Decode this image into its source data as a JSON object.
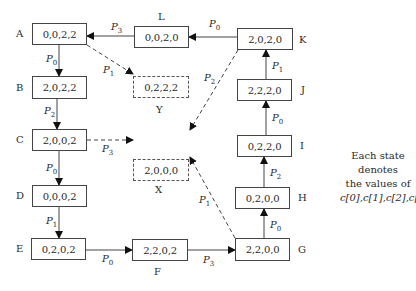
{
  "diagram": {
    "type": "state-transition",
    "states": [
      {
        "id": "A",
        "label": "A",
        "value": "0,0,2,2",
        "style": "solid"
      },
      {
        "id": "B",
        "label": "B",
        "value": "2,0,2,2",
        "style": "solid"
      },
      {
        "id": "C",
        "label": "C",
        "value": "2,0,0,2",
        "style": "solid"
      },
      {
        "id": "D",
        "label": "D",
        "value": "0,0,0,2",
        "style": "solid"
      },
      {
        "id": "E",
        "label": "E",
        "value": "0,2,0,2",
        "style": "solid"
      },
      {
        "id": "F",
        "label": "F",
        "value": "2,2,0,2",
        "style": "solid"
      },
      {
        "id": "G",
        "label": "G",
        "value": "2,2,0,0",
        "style": "solid"
      },
      {
        "id": "H",
        "label": "H",
        "value": "0,2,0,0",
        "style": "solid"
      },
      {
        "id": "I",
        "label": "I",
        "value": "0,2,2,0",
        "style": "solid"
      },
      {
        "id": "J",
        "label": "J",
        "value": "2,2,2,0",
        "style": "solid"
      },
      {
        "id": "K",
        "label": "K",
        "value": "2,0,2,0",
        "style": "solid"
      },
      {
        "id": "L",
        "label": "L",
        "value": "0,0,2,0",
        "style": "solid"
      },
      {
        "id": "Y",
        "label": "Y",
        "value": "0,2,2,2",
        "style": "dashed"
      },
      {
        "id": "X",
        "label": "X",
        "value": "2,0,0,0",
        "style": "dashed"
      }
    ],
    "edges": [
      {
        "from": "A",
        "to": "B",
        "process": "P",
        "sub": "0",
        "style": "solid"
      },
      {
        "from": "A",
        "to": "Y",
        "process": "P",
        "sub": "1",
        "style": "dashed"
      },
      {
        "from": "B",
        "to": "C",
        "process": "P",
        "sub": "2",
        "style": "solid"
      },
      {
        "from": "C",
        "to": "X",
        "process": "P",
        "sub": "3",
        "style": "dashed"
      },
      {
        "from": "C",
        "to": "D",
        "process": "P",
        "sub": "0",
        "style": "solid"
      },
      {
        "from": "D",
        "to": "E",
        "process": "P",
        "sub": "1",
        "style": "solid"
      },
      {
        "from": "E",
        "to": "F",
        "process": "P",
        "sub": "0",
        "style": "solid"
      },
      {
        "from": "F",
        "to": "G",
        "process": "P",
        "sub": "3",
        "style": "solid"
      },
      {
        "from": "G",
        "to": "X",
        "process": "P",
        "sub": "1",
        "style": "dashed"
      },
      {
        "from": "G",
        "to": "H",
        "process": "P",
        "sub": "0",
        "style": "solid"
      },
      {
        "from": "H",
        "to": "I",
        "process": "P",
        "sub": "2",
        "style": "solid"
      },
      {
        "from": "I",
        "to": "J",
        "process": "P",
        "sub": "0",
        "style": "solid"
      },
      {
        "from": "J",
        "to": "K",
        "process": "P",
        "sub": "1",
        "style": "solid"
      },
      {
        "from": "K",
        "to": "X",
        "process": "P",
        "sub": "2",
        "style": "dashed"
      },
      {
        "from": "K",
        "to": "L",
        "process": "P",
        "sub": "0",
        "style": "solid"
      },
      {
        "from": "L",
        "to": "A",
        "process": "P",
        "sub": "3",
        "style": "solid"
      }
    ],
    "legend": {
      "line1": "Each state denotes",
      "line2": "the values of",
      "line3": "c[0],c[1],c[2],c[3]"
    }
  }
}
